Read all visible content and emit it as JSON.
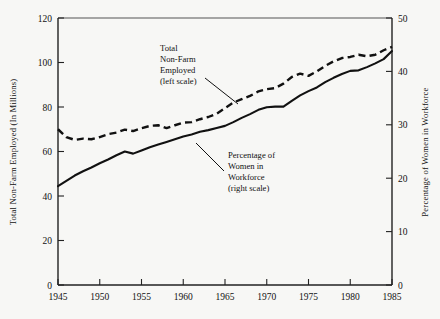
{
  "chart_data": {
    "type": "line",
    "title": "",
    "xlabel": "",
    "ylabel": "Total Non-Farm Employed (In Millions)",
    "y2label": "Percentage of Women in Workforce",
    "xlim": [
      1945,
      1985
    ],
    "ylim": [
      0,
      120
    ],
    "y2lim": [
      0,
      50
    ],
    "grid": false,
    "legend_position": "inline-annotations",
    "xticks": [
      1945,
      1950,
      1955,
      1960,
      1965,
      1970,
      1975,
      1980,
      1985
    ],
    "xtick_labels": [
      "1945",
      "1950",
      "1955",
      "1960",
      "1965",
      "1970",
      "1975",
      "1980",
      "1985"
    ],
    "yticks": [
      0,
      20,
      40,
      60,
      80,
      100,
      120
    ],
    "ytick_labels": [
      "0",
      "20",
      "40",
      "60",
      "80",
      "100",
      "120"
    ],
    "y2ticks": [
      0,
      10,
      20,
      30,
      40,
      50
    ],
    "y2tick_labels": [
      "0",
      "10",
      "20",
      "30",
      "40",
      "50"
    ],
    "x": [
      1945,
      1946,
      1947,
      1948,
      1949,
      1950,
      1951,
      1952,
      1953,
      1954,
      1955,
      1956,
      1957,
      1958,
      1959,
      1960,
      1961,
      1962,
      1963,
      1964,
      1965,
      1966,
      1967,
      1968,
      1969,
      1970,
      1971,
      1972,
      1973,
      1974,
      1975,
      1976,
      1977,
      1978,
      1979,
      1980,
      1981,
      1982,
      1983,
      1984,
      1985
    ],
    "series": [
      {
        "name": "Total Non-Farm Employed (left scale)",
        "axis": "left",
        "style": "dashed",
        "units": "millions",
        "values": [
          70.0,
          66.5,
          65.2,
          65.8,
          65.5,
          66.5,
          67.8,
          68.5,
          69.8,
          69.2,
          70.5,
          71.5,
          71.8,
          70.5,
          71.8,
          73.0,
          73.2,
          74.5,
          75.5,
          77.0,
          79.5,
          82.0,
          83.5,
          85.0,
          87.0,
          88.0,
          88.5,
          90.5,
          93.5,
          95.0,
          94.0,
          96.0,
          98.5,
          100.5,
          102.0,
          102.5,
          103.5,
          102.8,
          103.5,
          105.5,
          107.0
        ]
      },
      {
        "name": "Percentage of Women in Workforce (right scale)",
        "axis": "right",
        "style": "solid",
        "units": "percent",
        "values": [
          18.5,
          19.5,
          20.5,
          21.3,
          22.0,
          22.8,
          23.5,
          24.3,
          25.0,
          24.6,
          25.2,
          25.8,
          26.3,
          26.8,
          27.3,
          27.8,
          28.2,
          28.7,
          29.0,
          29.4,
          29.8,
          30.5,
          31.3,
          32.0,
          32.8,
          33.3,
          33.4,
          33.4,
          34.5,
          35.5,
          36.3,
          37.0,
          38.0,
          38.8,
          39.5,
          40.1,
          40.2,
          40.8,
          41.5,
          42.3,
          43.8
        ]
      }
    ],
    "annotations": [
      {
        "id": "annotation-total-nonfarm",
        "lines": [
          "Total",
          "Non-Farm",
          "Employed",
          "(left scale)"
        ],
        "target_series": "Total Non-Farm Employed (left scale)"
      },
      {
        "id": "annotation-percentage-women",
        "lines": [
          "Percentage of",
          "Women in",
          "Workforce",
          "(right scale)"
        ],
        "target_series": "Percentage of Women in Workforce (right scale)"
      }
    ],
    "colors": {
      "line": "#111111",
      "axis": "#222222",
      "background": "#f7f7f5"
    }
  }
}
